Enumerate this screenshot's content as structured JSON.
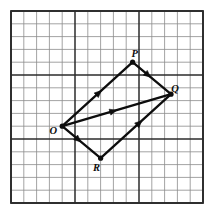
{
  "figure": {
    "background_color": "#ffffff",
    "ink_color": "#0d0d0d",
    "grid_minor_color": "#8c8c8c",
    "grid_major_color": "#2b2b2b"
  },
  "grid": {
    "columns": 15,
    "rows": 15,
    "cell_size_px": 12.8,
    "origin_x_px": 11,
    "origin_y_px": 11,
    "major_every": 5,
    "show_axis_numbers": false
  },
  "chart_data": {
    "type": "scatter",
    "title": "",
    "xlabel": "",
    "ylabel": "",
    "grid": true,
    "legend_position": "none",
    "xlim": [
      0,
      15
    ],
    "ylim": [
      0,
      15
    ],
    "points": [
      {
        "label": "O",
        "gx": 4.0,
        "gy": 9.0,
        "px": 62.2,
        "py": 126.2,
        "label_dx": -9,
        "label_dy": 8
      },
      {
        "label": "P",
        "gx": 9.5,
        "gy": 4.0,
        "px": 132.6,
        "py": 62.2,
        "label_dx": 2,
        "label_dy": -5
      },
      {
        "label": "Q",
        "gx": 12.5,
        "gy": 6.5,
        "px": 171.0,
        "py": 94.2,
        "label_dx": 4,
        "label_dy": -2
      },
      {
        "label": "R",
        "gx": 7.0,
        "gy": 11.5,
        "px": 100.6,
        "py": 158.2,
        "label_dx": -4,
        "label_dy": 13
      }
    ],
    "vectors": [
      {
        "name": "OP",
        "from": "O",
        "to": "P",
        "arrow_position": 0.52,
        "arrow_count": 1
      },
      {
        "name": "PQ",
        "from": "P",
        "to": "Q",
        "arrow_position": 0.4,
        "arrow_count": 1
      },
      {
        "name": "OQ",
        "from": "O",
        "to": "Q",
        "arrow_position": 0.47,
        "arrow_count": 1
      },
      {
        "name": "OR",
        "from": "O",
        "to": "R",
        "arrow_position": 0.42,
        "arrow_count": 1
      },
      {
        "name": "RQ",
        "from": "R",
        "to": "Q",
        "arrow_position": 0.55,
        "arrow_count": 1
      }
    ]
  },
  "labels": {
    "O": "O",
    "P": "P",
    "Q": "Q",
    "R": "R"
  }
}
